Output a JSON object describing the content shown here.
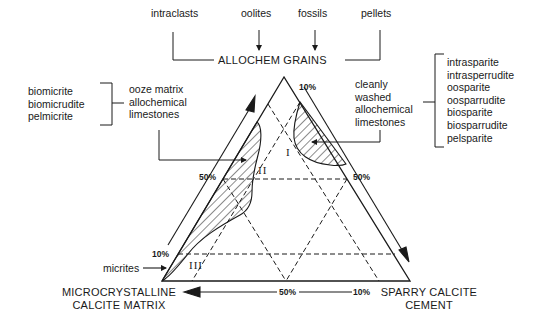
{
  "header": {
    "grain_types": [
      "intraclasts",
      "oolites",
      "fossils",
      "pellets"
    ],
    "title": "ALLOCHEM  GRAINS"
  },
  "left_group": {
    "names": [
      "biomicrite",
      "biomicrudite",
      "pelmicrite"
    ],
    "description": [
      "ooze matrix",
      "allochemical",
      "limestones"
    ]
  },
  "right_group": {
    "description": [
      "cleanly",
      "washed",
      "allochemical",
      "limestones"
    ],
    "names": [
      "intrasparite",
      "intrasperrudite",
      "oosparite",
      "oosparrudite",
      "biosparite",
      "biosparrudite",
      "pelsparite"
    ]
  },
  "micrites_label": "micrites",
  "fields": {
    "I": "I",
    "II": "II",
    "III": "III"
  },
  "percent_labels": {
    "right_top": "10%",
    "left_50": "50%",
    "right_50": "50%",
    "left_10": "10%",
    "bottom_50": "50%",
    "bottom_10": "10%"
  },
  "vertices": {
    "bottom_left": [
      "MICROCRYSTALLINE",
      "CALCITE  MATRIX"
    ],
    "bottom_right": [
      "SPARRY  CALCITE",
      "CEMENT"
    ]
  },
  "colors": {
    "ink": "#1a1a1a",
    "background": "#ffffff"
  }
}
